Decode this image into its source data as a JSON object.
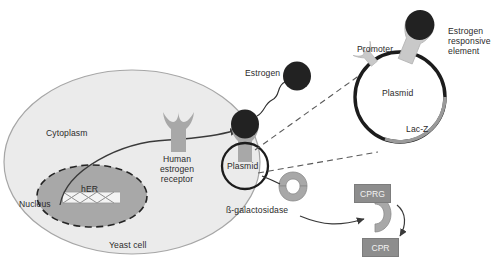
{
  "diagram": {
    "type": "biological-pathway"
  },
  "cell": {
    "name_label": "Yeast cell",
    "cytoplasm_label": "Cytoplasm",
    "nucleus_label": "Nucleus",
    "her_label": "hER"
  },
  "labels": {
    "estrogen": "Estrogen",
    "human_estrogen_receptor": "Human\nestrogen\nreceptor",
    "plasmid_cell": "Plasmid",
    "beta_galactosidase": "ß-galactosidase"
  },
  "plasmid": {
    "name_label": "Plasmid",
    "promoter_label": "Promoter",
    "lacz_label": "Lac-Z",
    "ere_label": "Estrogen\nresponsive\nelement"
  },
  "substrate": {
    "cprg_label": "CPRG",
    "cpr_label": "CPR"
  },
  "colors": {
    "cell_fill": "#ebebeb",
    "cell_stroke": "#a6a6a6",
    "nucleus_fill": "#a8a8a8",
    "nucleus_stroke": "#262626",
    "receptor_fill": "#a8a8a8",
    "ligand_fill": "#262626",
    "plasmid_ring": "#1c1c1c",
    "lacz_segment": "#9a9a9a",
    "ere_fill": "#c9c9c9",
    "box_fill": "#8d8d8d",
    "box_text": "#f2f2f2",
    "text": "#2b2b2b",
    "dashed": "#555555"
  }
}
